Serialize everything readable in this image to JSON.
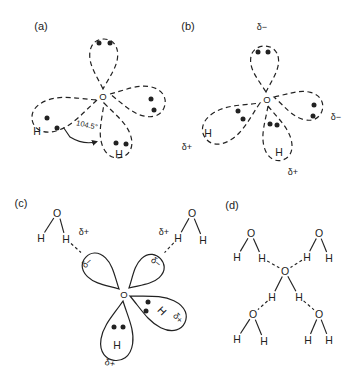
{
  "colors": {
    "ink": "#222222",
    "background": "#ffffff"
  },
  "symbols": {
    "oxygen": "O",
    "hydrogen": "H",
    "delta_plus": "δ+",
    "delta_minus": "δ−"
  },
  "panels": [
    {
      "label": "(a)",
      "bond_angle": "104.5°"
    },
    {
      "label": "(b)"
    },
    {
      "label": "(c)"
    },
    {
      "label": "(d)"
    }
  ]
}
